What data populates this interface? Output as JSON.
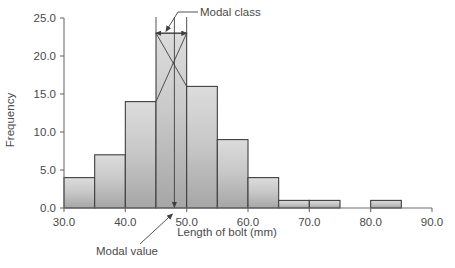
{
  "chart_data": {
    "type": "bar",
    "title": "",
    "subtitle": "",
    "xlabel": "Length of bolt (mm)",
    "ylabel": "Frequency",
    "xlim": [
      30.0,
      90.0
    ],
    "ylim": [
      0.0,
      25.0
    ],
    "grid": false,
    "legend_position": "none",
    "bin_width": 5,
    "x_tick_labels": [
      "30.0",
      "40.0",
      "50.0",
      "60.0",
      "70.0",
      "80.0",
      "90.0"
    ],
    "x_tick_values": [
      30,
      40,
      50,
      60,
      70,
      80,
      90
    ],
    "y_tick_labels": [
      "0.0",
      "5.0",
      "10.0",
      "15.0",
      "20.0",
      "25.0"
    ],
    "y_tick_values": [
      0,
      5,
      10,
      15,
      20,
      25
    ],
    "categories": [
      "30-35",
      "35-40",
      "40-45",
      "45-50",
      "50-55",
      "55-60",
      "60-65",
      "65-70",
      "70-75",
      "75-80",
      "80-85",
      "85-90"
    ],
    "bins": [
      {
        "low": 30,
        "high": 35,
        "value": 4
      },
      {
        "low": 35,
        "high": 40,
        "value": 7
      },
      {
        "low": 40,
        "high": 45,
        "value": 14
      },
      {
        "low": 45,
        "high": 50,
        "value": 23
      },
      {
        "low": 50,
        "high": 55,
        "value": 16
      },
      {
        "low": 55,
        "high": 60,
        "value": 9
      },
      {
        "low": 60,
        "high": 65,
        "value": 4
      },
      {
        "low": 65,
        "high": 70,
        "value": 1
      },
      {
        "low": 70,
        "high": 75,
        "value": 1
      },
      {
        "low": 75,
        "high": 80,
        "value": 0
      },
      {
        "low": 80,
        "high": 85,
        "value": 1
      },
      {
        "low": 85,
        "high": 90,
        "value": 0
      }
    ],
    "values": [
      4,
      7,
      14,
      23,
      16,
      9,
      4,
      1,
      1,
      0,
      1,
      0
    ],
    "annotations": [
      {
        "name": "modal-class",
        "label": "Modal class",
        "kind": "double-arrow-span",
        "span_low": 45,
        "span_high": 50,
        "at_value": 23
      },
      {
        "name": "modal-value",
        "label": "Modal value",
        "kind": "down-arrow",
        "x_value": 48.0,
        "from_value": 23,
        "to_value": 0
      }
    ],
    "colors": {
      "bar_fill_top": "#d5d5d5",
      "bar_fill_bottom": "#a9a9a9",
      "bar_edge": "#3f3f3f",
      "axis": "#6d6d6d",
      "text": "#4a4a4a",
      "background": "#ffffff"
    }
  }
}
